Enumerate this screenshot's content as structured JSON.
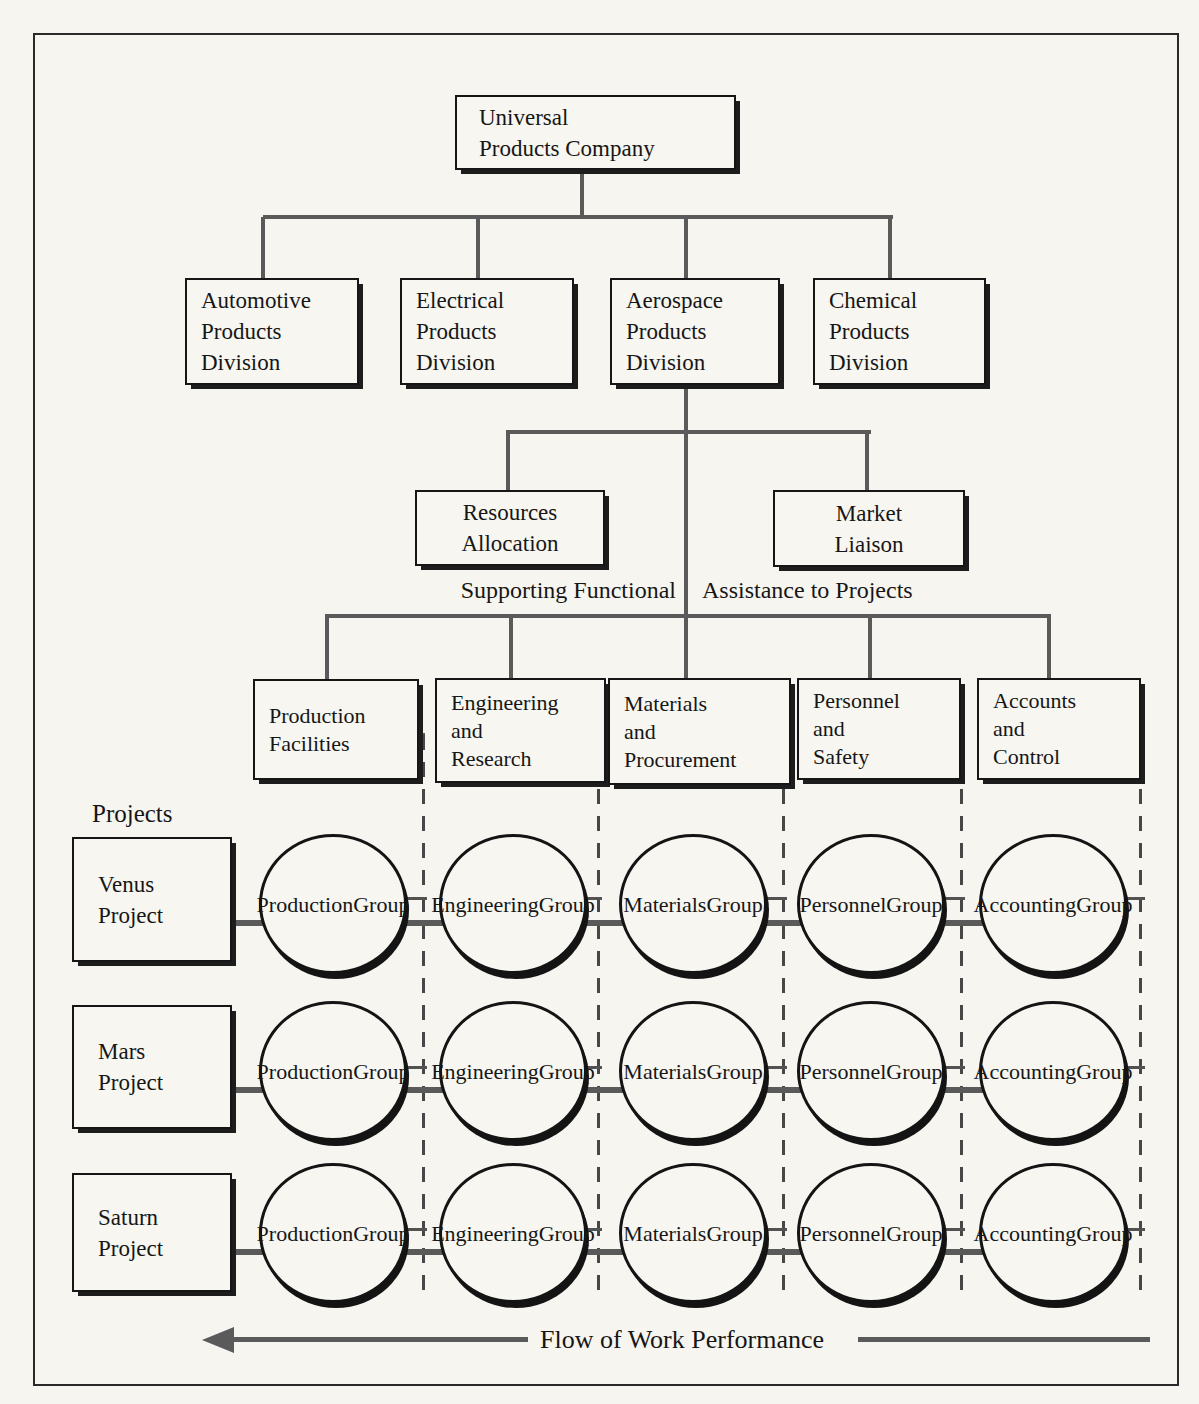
{
  "palette": {
    "paper": "#f6f5f0",
    "ink": "#161616",
    "connector_gray": "#5a5a5a",
    "dash_gray": "#474747"
  },
  "company": {
    "lines": [
      "Universal",
      "Products Company"
    ]
  },
  "divisions": [
    {
      "id": "automotive",
      "lines": [
        "Automotive",
        "Products",
        "Division"
      ]
    },
    {
      "id": "electrical",
      "lines": [
        "Electrical",
        "Products",
        "Division"
      ]
    },
    {
      "id": "aerospace",
      "lines": [
        "Aerospace",
        "Products",
        "Division"
      ]
    },
    {
      "id": "chemical",
      "lines": [
        "Chemical",
        "Products",
        "Division"
      ]
    }
  ],
  "staff_units": [
    {
      "id": "resources-allocation",
      "lines": [
        "Resources",
        "Allocation"
      ]
    },
    {
      "id": "market-liaison",
      "lines": [
        "Market",
        "Liaison"
      ]
    }
  ],
  "captions": {
    "supporting": "Supporting Functional",
    "assistance": "Assistance to Projects",
    "projects_heading": "Projects",
    "flow": "Flow of Work Performance"
  },
  "functions": [
    {
      "id": "production-facilities",
      "lines": [
        "Production",
        "Facilities"
      ]
    },
    {
      "id": "engineering-research",
      "lines": [
        "Engineering",
        "and",
        "Research"
      ]
    },
    {
      "id": "materials-procurement",
      "lines": [
        "Materials",
        "and",
        "Procurement"
      ]
    },
    {
      "id": "personnel-safety",
      "lines": [
        "Personnel",
        "and",
        "Safety"
      ]
    },
    {
      "id": "accounts-control",
      "lines": [
        "Accounts",
        "and",
        "Control"
      ]
    }
  ],
  "projects": [
    {
      "id": "venus",
      "lines": [
        "Venus",
        "Project"
      ]
    },
    {
      "id": "mars",
      "lines": [
        "Mars",
        "Project"
      ]
    },
    {
      "id": "saturn",
      "lines": [
        "Saturn",
        "Project"
      ]
    }
  ],
  "groups": [
    {
      "lines": [
        "Production",
        "Group"
      ]
    },
    {
      "lines": [
        "Engineering",
        "Group"
      ]
    },
    {
      "lines": [
        "Materials",
        "Group"
      ]
    },
    {
      "lines": [
        "Personnel",
        "Group"
      ]
    },
    {
      "lines": [
        "Accounting",
        "Group"
      ]
    }
  ]
}
